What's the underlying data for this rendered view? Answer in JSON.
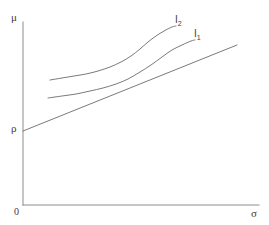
{
  "figure": {
    "kind": "line-diagram",
    "background_color": "#ffffff",
    "stroke_color": "#6b6b6b",
    "axis_color": "#8d8d8d",
    "text_color": "#3a3a3a",
    "width": 269,
    "height": 225
  },
  "axes": {
    "y_label": "μ",
    "x_label": "σ",
    "origin_label": "0",
    "intercept_label": "ρ",
    "y_axis": {
      "x": 23,
      "y_top": 22,
      "y_bottom": 205
    },
    "x_axis": {
      "y": 205,
      "x_left": 23,
      "x_right": 259
    }
  },
  "curve_labels": [
    {
      "name": "i2",
      "base": "I",
      "sub": "2"
    },
    {
      "name": "i1",
      "base": "I",
      "sub": "1"
    }
  ],
  "chart_data": {
    "type": "line",
    "title": "",
    "xlabel": "σ",
    "ylabel": "μ",
    "grid": false,
    "legend": "inline-end-labels",
    "xlim": [
      23,
      259
    ],
    "ylim": [
      205,
      22
    ],
    "note": "Coordinates are in screenshot pixel space; y increases downward.",
    "series": [
      {
        "name": "I2",
        "label": "I₂",
        "description": "upper indifference curve, convex increasing",
        "label_anchor": [
          175,
          15
        ],
        "points": [
          [
            50,
            80
          ],
          [
            62,
            78
          ],
          [
            74,
            76
          ],
          [
            86,
            74
          ],
          [
            98,
            71
          ],
          [
            110,
            67
          ],
          [
            121,
            62
          ],
          [
            131,
            56
          ],
          [
            140,
            49
          ],
          [
            148,
            42
          ],
          [
            156,
            36
          ],
          [
            164,
            31
          ],
          [
            172,
            27
          ],
          [
            176,
            26
          ]
        ]
      },
      {
        "name": "I1",
        "label": "I₁",
        "description": "lower indifference curve, convex increasing",
        "label_anchor": [
          194,
          29
        ],
        "points": [
          [
            48,
            98
          ],
          [
            62,
            96
          ],
          [
            76,
            94
          ],
          [
            90,
            91
          ],
          [
            103,
            88
          ],
          [
            116,
            84
          ],
          [
            128,
            79
          ],
          [
            140,
            72
          ],
          [
            151,
            65
          ],
          [
            162,
            57
          ],
          [
            172,
            50
          ],
          [
            182,
            45
          ],
          [
            191,
            41
          ],
          [
            195,
            40
          ]
        ]
      },
      {
        "name": "capital-market-line",
        "label": "",
        "description": "straight line from ρ on the μ-axis, tangent to the indifference curves",
        "label_anchor": null,
        "points": [
          [
            23,
            131
          ],
          [
            237,
            45
          ]
        ]
      }
    ],
    "annotations": [
      {
        "text": "ρ",
        "at": [
          11,
          123
        ],
        "meaning": "riskless-rate intercept on the μ axis"
      },
      {
        "text": "0",
        "at": [
          14,
          207
        ],
        "meaning": "origin"
      },
      {
        "text": "μ",
        "at": [
          11,
          12
        ],
        "meaning": "expected return axis"
      },
      {
        "text": "σ",
        "at": [
          251,
          208
        ],
        "meaning": "risk (standard deviation) axis"
      }
    ]
  }
}
